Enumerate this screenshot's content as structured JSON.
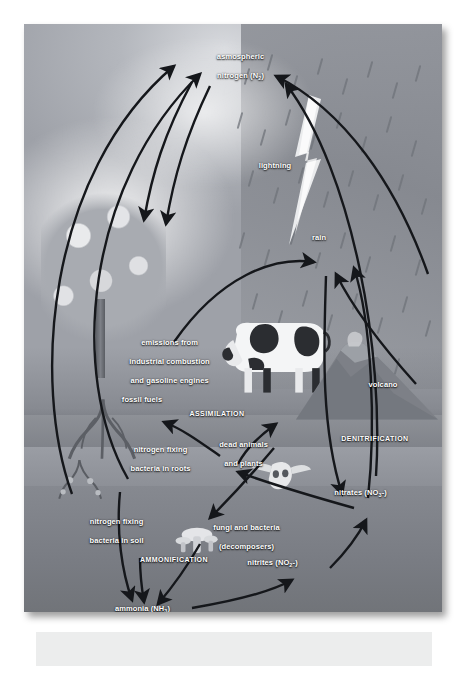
{
  "diagram": {
    "labels": {
      "atmospheric_nitrogen": "asmospheric\nnitrogen (N2)",
      "atmospheric_nitrogen_main": "asmospheric",
      "atmospheric_nitrogen_sub": "nitrogen (N",
      "atmospheric_nitrogen_num": "2",
      "lightning": "lightning",
      "rain": "rain",
      "volcano": "volcano",
      "emissions": "emissions from\nindustrial combustion\nand gasoline engines",
      "emissions_l1": "emissions from",
      "emissions_l2": "industrial combustion",
      "emissions_l3": "and gasoline engines",
      "fossil_fuels": "fossil fuels",
      "assimilation": "ASSIMILATION",
      "denitrification": "DENITRIFICATION",
      "ammonification": "AMMONIFICATION",
      "bacteria_roots_l1": "nitrogen fixing",
      "bacteria_roots_l2": "bacteria in roots",
      "dead_l1": "dead animals",
      "dead_l2": "and plants",
      "bacteria_soil_l1": "nitrogen fixing",
      "bacteria_soil_l2": "bacteria in soil",
      "fungi_l1": "fungi and bacteria",
      "fungi_l2": "(decomposers)",
      "nitrates_text": "nitrates (NO",
      "nitrates_sub": "3",
      "nitrates_charge": "-)",
      "nitrites_text": "nitrites (NO",
      "nitrites_sub": "2",
      "nitrites_charge": "-)",
      "ammonia_text": "ammonia (NH",
      "ammonia_sub": "3",
      "ammonia_close": ")"
    },
    "colors": {
      "sky": "#b4b7bd",
      "storm": "#8f9299",
      "soil": "#868990",
      "arrow": "#1a1c20",
      "label_text": "#ffffff",
      "caption_bar": "#eceded",
      "page_background": "#ffffff"
    },
    "scene_elements": [
      "tree",
      "cow",
      "volcano",
      "lightning-bolt",
      "rain-streaks",
      "cow-skull",
      "mushrooms",
      "roots",
      "soil-layers",
      "clouds"
    ]
  }
}
